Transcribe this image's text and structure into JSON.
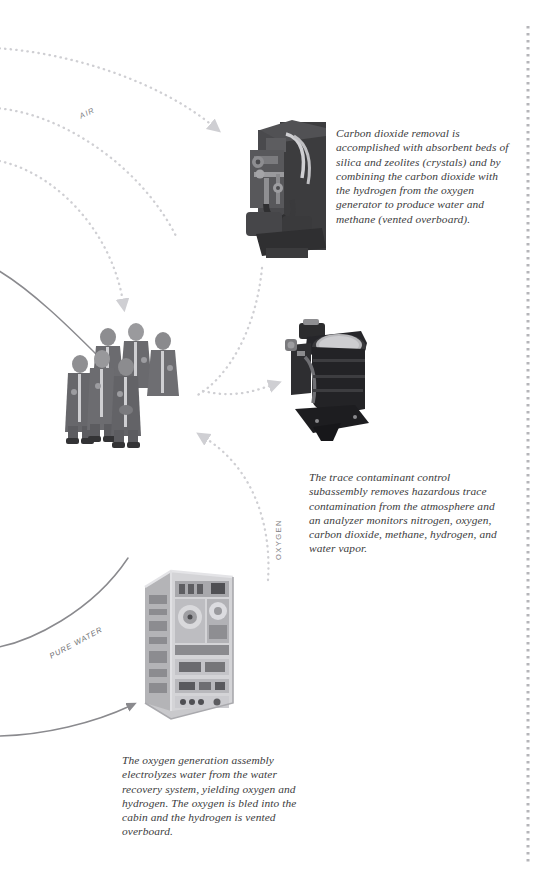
{
  "page": {
    "background_color": "#ffffff",
    "width": 537,
    "height": 872
  },
  "captions": {
    "co2_removal": "Carbon dioxide removal is accomplished with absorbent beds of silica and zeolites (crystals) and by combining the carbon dioxide with the hydrogen from the oxygen generator to produce water and methane (vented overboard).",
    "trace_contaminant": "The trace contaminant control subassembly removes hazardous trace contamination from the atmosphere and an analyzer monitors nitrogen, oxygen, carbon dioxide, methane, hydrogen, and water vapor.",
    "oxygen_generation": "The oxygen generation assembly electrolyzes water from the water recovery system, yielding oxygen and hydrogen. The oxygen is bled into the cabin and the hydrogen is vented overboard."
  },
  "flow_labels": {
    "air": "AIR",
    "oxygen": "OXYGEN",
    "pure_water": "PURE WATER"
  },
  "photos": {
    "co2_removal_assembly": "co2-removal-assembly-photo",
    "crew_group": "astronaut-crew-photo",
    "trace_contaminant_unit": "trace-contaminant-control-photo",
    "oxygen_generation_rack": "oxygen-generation-assembly-photo"
  },
  "colors": {
    "caption_text": "#3b3b3d",
    "label_text": "#7e7e82",
    "dotted_flow": "#cfcfd3",
    "solid_flow": "#8a8a8e",
    "edge_dots": "#b5b5b9"
  }
}
